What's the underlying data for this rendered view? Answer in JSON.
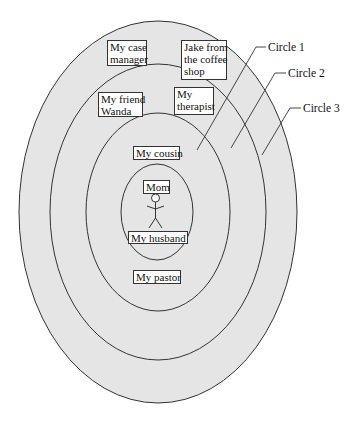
{
  "colors": {
    "background": "#ffffff",
    "ring_fill": "#e5e5e5",
    "stroke": "#333333",
    "label_bg": "#ffffff"
  },
  "rings": [
    {
      "name": "Circle 3",
      "cx": 158,
      "cy": 212,
      "rx": 139,
      "ry": 191
    },
    {
      "name": "Circle 2",
      "cx": 158,
      "cy": 212,
      "rx": 108,
      "ry": 148
    },
    {
      "name": "Circle 1",
      "cx": 158,
      "cy": 212,
      "rx": 72,
      "ry": 99
    },
    {
      "name": "Center",
      "cx": 157,
      "cy": 212,
      "rx": 36,
      "ry": 48
    }
  ],
  "circle_labels": {
    "circle1": "Circle 1",
    "circle2": "Circle 2",
    "circle3": "Circle 3"
  },
  "people": {
    "case_manager": [
      "My case",
      "manager"
    ],
    "jake": [
      "Jake from",
      "the coffee",
      "shop"
    ],
    "friend_wanda": [
      "My friend",
      "Wanda"
    ],
    "therapist": [
      "My",
      "therapist"
    ],
    "cousin": "My cousin",
    "mom": "Mom",
    "husband": "My husband",
    "pastor": "My pastor"
  }
}
